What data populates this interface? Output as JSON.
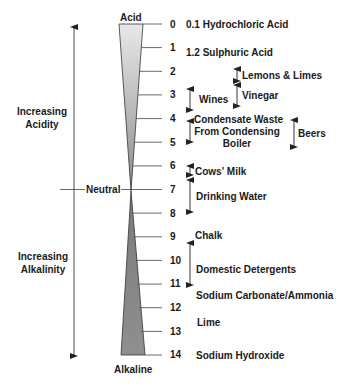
{
  "scale": {
    "top_label": "Acid",
    "bottom_label": "Alkaline",
    "neutral_label": "Neutral",
    "ticks": [
      "0",
      "1",
      "2",
      "3",
      "4",
      "5",
      "6",
      "7",
      "8",
      "9",
      "10",
      "11",
      "12",
      "13",
      "14"
    ]
  },
  "axis": {
    "acidity_label_line1": "Increasing",
    "acidity_label_line2": "Acidity",
    "alkalinity_label_line1": "Increasing",
    "alkalinity_label_line2": "Alkalinity"
  },
  "substances": {
    "hydrochloric": "0.1 Hydrochloric Acid",
    "sulphuric": "1.2 Sulphuric Acid",
    "lemons": "Lemons & Limes",
    "vinegar": "Vinegar",
    "wines": "Wines",
    "condensate_line1": "Condensate Waste",
    "condensate_line2": "From Condensing",
    "condensate_line3": "Boiler",
    "beers": "Beers",
    "milk": "Cows' Milk",
    "water": "Drinking Water",
    "chalk": "Chalk",
    "detergents": "Domestic Detergents",
    "sodium_carbonate": "Sodium Carbonate/Ammonia",
    "lime": "Lime",
    "sodium_hydroxide": "Sodium Hydroxide"
  },
  "colors": {
    "acid_fill_light": "#e6e6e6",
    "acid_fill_dark": "#8a8a8a",
    "alkaline_fill_light": "#9a9a9a",
    "alkaline_fill_dark": "#6e6e6e",
    "line": "#333333"
  }
}
